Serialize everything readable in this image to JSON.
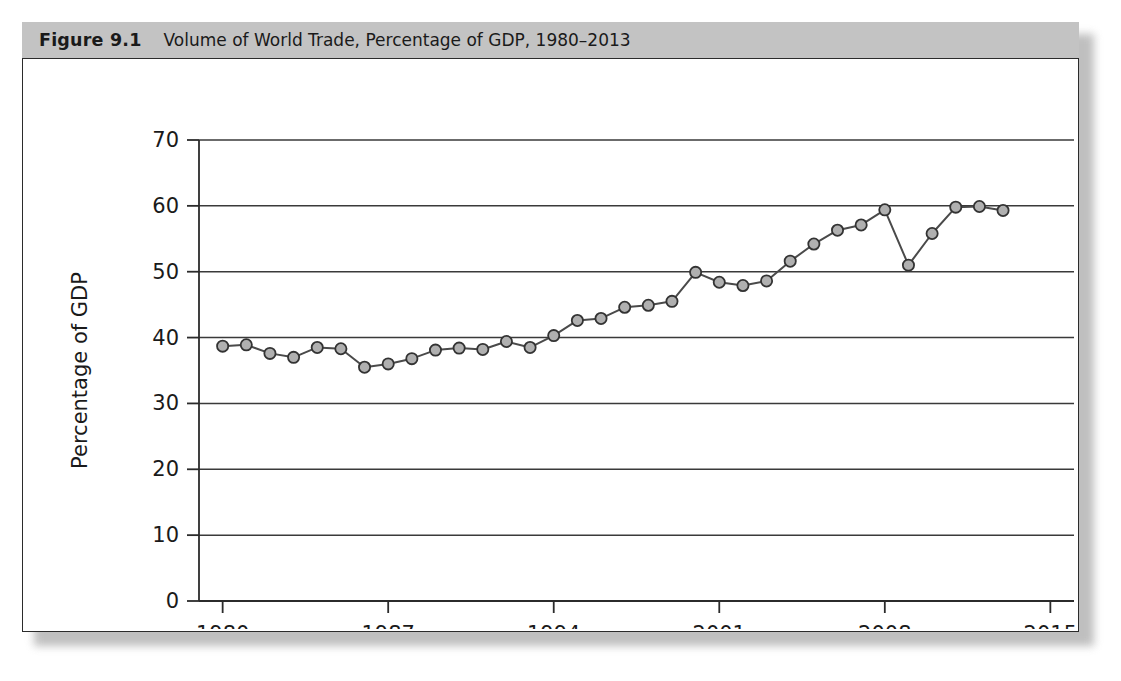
{
  "figure": {
    "number_label": "Figure 9.1",
    "caption": "Volume of World Trade, Percentage of GDP, 1980–2013",
    "title_bar_color": "#c3c3c3",
    "frame_color": "#2b2b2b",
    "background_color": "#ffffff"
  },
  "chart_data": {
    "type": "line",
    "title": "Volume of World Trade, Percentage of GDP, 1980–2013",
    "xlabel": "",
    "ylabel": "Percentage of GDP",
    "xlim": [
      1979,
      2016
    ],
    "ylim": [
      0,
      70
    ],
    "x_ticks": [
      1980,
      1987,
      1994,
      2001,
      2008,
      2015
    ],
    "y_ticks": [
      0,
      10,
      20,
      30,
      40,
      50,
      60,
      70
    ],
    "grid": "horizontal",
    "legend": "none",
    "series_color": "#4a4a4a",
    "marker_fill": "#b0b0b0",
    "marker_edge": "#333333",
    "x": [
      1980,
      1981,
      1982,
      1983,
      1984,
      1985,
      1986,
      1987,
      1988,
      1989,
      1990,
      1991,
      1992,
      1993,
      1994,
      1995,
      1996,
      1997,
      1998,
      1999,
      2000,
      2001,
      2002,
      2003,
      2004,
      2005,
      2006,
      2007,
      2008,
      2009,
      2010,
      2011,
      2012,
      2013
    ],
    "values": [
      38.7,
      38.9,
      37.6,
      37.0,
      38.5,
      38.3,
      35.5,
      36.0,
      36.8,
      38.1,
      38.4,
      38.2,
      39.4,
      38.5,
      40.3,
      42.6,
      42.9,
      44.6,
      44.9,
      45.5,
      49.9,
      48.4,
      47.9,
      48.6,
      51.6,
      54.2,
      56.3,
      57.1,
      59.4,
      51.0,
      55.8,
      59.8,
      59.9,
      59.3
    ]
  },
  "icons": {
    "marker": "circle-marker"
  }
}
